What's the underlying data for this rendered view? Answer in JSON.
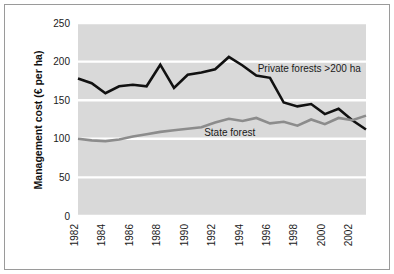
{
  "figure": {
    "background_color": "#ffffff",
    "frame_color": "#9a9a9a",
    "plot_background_color": "#d9d9d9",
    "gridline_color": "#ffffff"
  },
  "chart_data": {
    "type": "line",
    "title": "",
    "xlabel": "",
    "ylabel": "Management cost (€ per ha)",
    "xlim": [
      1982,
      2003
    ],
    "ylim": [
      0,
      250
    ],
    "yticks": [
      0,
      50,
      100,
      150,
      200,
      250
    ],
    "ytick_labels": [
      "0",
      "50",
      "100",
      "150",
      "200",
      "250"
    ],
    "xticks": [
      1982,
      1984,
      1986,
      1988,
      1990,
      1992,
      1994,
      1996,
      1998,
      2000,
      2002
    ],
    "xtick_labels": [
      "1982",
      "1984",
      "1986",
      "1988",
      "1990",
      "1992",
      "1994",
      "1996",
      "1998",
      "2000",
      "2002"
    ],
    "xtick_rotation": 90,
    "grid": true,
    "grid_axis": "y",
    "legend_position": "inline-annotation",
    "x": [
      1982,
      1983,
      1984,
      1985,
      1986,
      1987,
      1988,
      1989,
      1990,
      1991,
      1992,
      1993,
      1994,
      1995,
      1996,
      1997,
      1998,
      1999,
      2000,
      2001,
      2002,
      2003
    ],
    "series": [
      {
        "name": "Private forests >200 ha",
        "color": "#111111",
        "line_width": 2.6,
        "values": [
          178,
          172,
          159,
          168,
          170,
          168,
          196,
          166,
          183,
          186,
          190,
          206,
          195,
          182,
          179,
          147,
          142,
          145,
          132,
          139,
          124,
          112
        ]
      },
      {
        "name": "State forest",
        "color": "#8c8c8c",
        "line_width": 2.6,
        "values": [
          100,
          98,
          97,
          99,
          103,
          106,
          109,
          111,
          113,
          115,
          121,
          126,
          123,
          127,
          120,
          122,
          117,
          125,
          119,
          127,
          124,
          130
        ]
      }
    ],
    "annotations": [
      {
        "text": "Private forests >200 ha",
        "x": 1995.1,
        "y": 187,
        "color": "#1a1a1a"
      },
      {
        "text": "State forest",
        "x": 1991.2,
        "y": 103,
        "color": "#1a1a1a"
      }
    ]
  }
}
